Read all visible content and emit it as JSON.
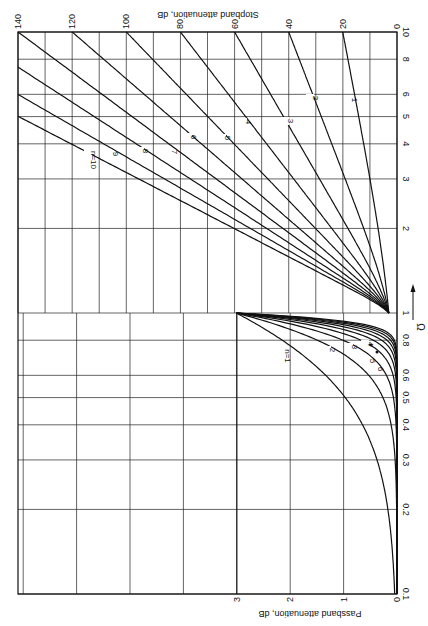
{
  "chart_data": {
    "type": "line",
    "orientation": "rotated 90° clockwise (Ω increases upward; attenuation increases leftward)",
    "xlabel": "Ω",
    "xscale": "log",
    "xlim": [
      0.1,
      10
    ],
    "x_ticks": [
      0.1,
      0.2,
      0.3,
      0.4,
      0.5,
      0.6,
      0.8,
      1,
      2,
      3,
      4,
      5,
      6,
      8,
      10
    ],
    "x_tick_labels": [
      "0.1",
      "0.2",
      "0.3",
      "0.4",
      "0.5",
      "0.6",
      "0.8",
      "1",
      "2",
      "3",
      "4",
      "5",
      "6",
      "8",
      "10"
    ],
    "stopband": {
      "ylabel": "Stopband attenuation, dB",
      "ylim": [
        0,
        140
      ],
      "y_ticks": [
        0,
        20,
        40,
        60,
        80,
        100,
        120,
        140
      ],
      "omega_range": [
        1,
        10
      ],
      "formula": "A = 10·log10(1 + Ω^(2n))",
      "series": [
        {
          "name": "1",
          "n": 1,
          "values_at": {
            "1": 3.01,
            "2": 6.99,
            "5": 14.15,
            "10": 20.04
          }
        },
        {
          "name": "2",
          "n": 2,
          "values_at": {
            "1": 3.01,
            "2": 12.3,
            "5": 27.96,
            "10": 40.0
          }
        },
        {
          "name": "3",
          "n": 3,
          "values_at": {
            "1": 3.01,
            "2": 18.13,
            "5": 41.94,
            "10": 60.0
          }
        },
        {
          "name": "4",
          "n": 4,
          "values_at": {
            "1": 3.01,
            "2": 24.1,
            "5": 55.92,
            "10": 80.0
          }
        },
        {
          "name": "5",
          "n": 5,
          "values_at": {
            "1": 3.01,
            "2": 30.11,
            "5": 69.9,
            "10": 100.0
          }
        },
        {
          "name": "6",
          "n": 6,
          "values_at": {
            "1": 3.01,
            "2": 36.12,
            "5": 83.88,
            "10": 120.0
          }
        },
        {
          "name": "7",
          "n": 7,
          "values_at": {
            "1": 3.01,
            "2": 42.14,
            "5": 97.86,
            "10": 140.0
          }
        },
        {
          "name": "8",
          "n": 8,
          "values_at": {
            "1": 3.01,
            "2": 48.16,
            "5": 111.84
          }
        },
        {
          "name": "9",
          "n": 9,
          "values_at": {
            "1": 3.01,
            "2": 54.19,
            "5": 125.82
          }
        },
        {
          "name": "n=10",
          "n": 10,
          "values_at": {
            "1": 3.01,
            "2": 60.21,
            "5": 139.79
          }
        }
      ]
    },
    "passband": {
      "ylabel": "Passband attenuation, dB",
      "ylim": [
        0,
        3
      ],
      "y_ticks": [
        0,
        1,
        2,
        3
      ],
      "omega_range": [
        0.1,
        1
      ],
      "formula": "A = 10·log10(1 + Ω^(2n))",
      "series": [
        {
          "name": "n=1",
          "n": 1,
          "values_at": {
            "0.3": 0.37,
            "0.5": 0.97,
            "0.8": 2.15,
            "1": 3.01
          }
        },
        {
          "name": "2",
          "n": 2,
          "values_at": {
            "0.3": 0.04,
            "0.5": 0.26,
            "0.8": 1.41,
            "1": 3.01
          }
        },
        {
          "name": "3",
          "n": 3,
          "values_at": {
            "0.5": 0.07,
            "0.8": 0.91,
            "1": 3.01
          }
        },
        {
          "name": "4",
          "n": 4,
          "values_at": {
            "0.5": 0.02,
            "0.8": 0.57,
            "1": 3.01
          }
        },
        {
          "name": "5",
          "n": 5,
          "values_at": {
            "0.8": 0.36,
            "1": 3.01
          }
        },
        {
          "name": "6",
          "n": 6,
          "values_at": {
            "0.8": 0.22,
            "1": 3.01
          }
        },
        {
          "name": "7",
          "n": 7,
          "values_at": {
            "0.8": 0.14,
            "1": 3.01
          }
        },
        {
          "name": "8",
          "n": 8,
          "values_at": {
            "0.8": 0.09,
            "1": 3.01
          }
        },
        {
          "name": "9",
          "n": 9,
          "values_at": {
            "0.8": 0.06,
            "1": 3.01
          }
        },
        {
          "name": "10",
          "n": 10,
          "values_at": {
            "0.8": 0.04,
            "1": 3.01
          }
        }
      ]
    },
    "grid": true,
    "legend": "inline curve labels"
  },
  "labels": {
    "stopband_axis_title": "Stopband attenuation, dB",
    "passband_axis_title": "Passband attenuation, dB",
    "omega_symbol": "Ω",
    "stopband_ticks": [
      "0",
      "20",
      "40",
      "60",
      "80",
      "100",
      "120",
      "140"
    ],
    "passband_ticks": [
      "0",
      "1",
      "2",
      "3"
    ],
    "omega_ticks": [
      "0.1",
      "0.2",
      "0.3",
      "0.4",
      "0.5",
      "0.6",
      "0.8",
      "1",
      "2",
      "3",
      "4",
      "5",
      "6",
      "8",
      "10"
    ],
    "stopband_curve_labels": [
      {
        "text": "1",
        "x": 349,
        "y": 100
      },
      {
        "text": "2",
        "x": 310,
        "y": 98
      },
      {
        "text": "3",
        "x": 285,
        "y": 121
      },
      {
        "text": "4",
        "x": 243,
        "y": 122
      },
      {
        "text": "5",
        "x": 222,
        "y": 138
      },
      {
        "text": "6",
        "x": 188,
        "y": 137
      },
      {
        "text": "7",
        "x": 169,
        "y": 152
      },
      {
        "text": "8",
        "x": 140,
        "y": 151
      },
      {
        "text": "9",
        "x": 110,
        "y": 154
      },
      {
        "text": "n=10",
        "x": 88,
        "y": 160
      }
    ],
    "passband_curve_labels": [
      {
        "text": "n=1",
        "x": 282,
        "y": 356
      },
      {
        "text": "2",
        "x": 327,
        "y": 350
      },
      {
        "text": "3",
        "x": 349,
        "y": 347
      },
      {
        "text": "4",
        "x": 365,
        "y": 344
      },
      {
        "text": "5",
        "x": 367,
        "y": 361
      },
      {
        "text": "6",
        "x": 375,
        "y": 369
      }
    ]
  },
  "layout": {
    "plot_left": 18,
    "plot_right": 397,
    "plot_top": 32,
    "plot_bottom": 594,
    "stopband_px_per_db": 2.707,
    "passband_px_per_db": 53.4,
    "line_color": "#111111",
    "grid_color": "#222222"
  }
}
